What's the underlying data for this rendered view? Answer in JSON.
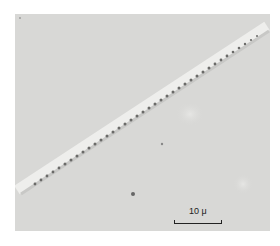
{
  "image": {
    "subject": "micrograph of diagonal serrated fiber",
    "scale_bar": {
      "label": "10 μ"
    }
  },
  "colors": {
    "background": "#d9d9d7",
    "fiber_highlight": "#ededeb",
    "fiber_teeth": "#6a6a68"
  }
}
